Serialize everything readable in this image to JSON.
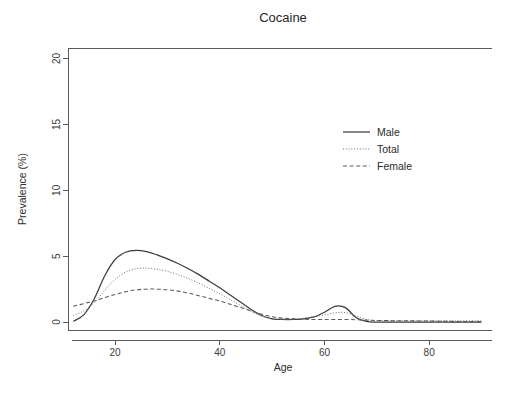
{
  "chart_data": {
    "type": "line",
    "title": "Cocaine",
    "xlabel": "Age",
    "ylabel": "Prevalence (%)",
    "xlim": [
      11,
      92
    ],
    "ylim": [
      -0.6,
      20.8
    ],
    "xticks": [
      20,
      40,
      60,
      80
    ],
    "yticks": [
      0,
      5,
      10,
      15,
      20
    ],
    "grid": false,
    "legend_position": "upper-right-inside",
    "x": [
      12,
      14,
      16,
      18,
      20,
      22,
      24,
      26,
      28,
      30,
      32,
      34,
      36,
      38,
      40,
      42,
      44,
      46,
      48,
      50,
      52,
      54,
      56,
      58,
      60,
      62,
      64,
      66,
      68,
      70,
      75,
      80,
      85,
      90
    ],
    "series": [
      {
        "name": "Male",
        "style": "solid",
        "values": [
          0.05,
          0.55,
          1.75,
          3.5,
          4.75,
          5.3,
          5.45,
          5.35,
          5.1,
          4.8,
          4.45,
          4.05,
          3.6,
          3.1,
          2.6,
          2.05,
          1.5,
          0.95,
          0.5,
          0.25,
          0.2,
          0.2,
          0.25,
          0.4,
          0.75,
          1.2,
          1.1,
          0.35,
          0.05,
          0.0,
          0.0,
          0.0,
          0.0,
          0.0
        ]
      },
      {
        "name": "Total",
        "style": "dotted",
        "values": [
          0.5,
          0.85,
          1.45,
          2.4,
          3.25,
          3.8,
          4.05,
          4.1,
          4.0,
          3.85,
          3.6,
          3.3,
          2.95,
          2.55,
          2.15,
          1.7,
          1.25,
          0.8,
          0.45,
          0.25,
          0.2,
          0.22,
          0.3,
          0.4,
          0.55,
          0.7,
          0.72,
          0.45,
          0.2,
          0.12,
          0.1,
          0.1,
          0.1,
          0.1
        ]
      },
      {
        "name": "Female",
        "style": "dashed",
        "values": [
          1.2,
          1.4,
          1.6,
          1.85,
          2.1,
          2.3,
          2.45,
          2.5,
          2.5,
          2.45,
          2.35,
          2.2,
          2.0,
          1.8,
          1.6,
          1.35,
          1.1,
          0.85,
          0.6,
          0.4,
          0.3,
          0.25,
          0.22,
          0.2,
          0.2,
          0.2,
          0.2,
          0.18,
          0.15,
          0.12,
          0.1,
          0.08,
          0.05,
          0.05
        ]
      }
    ],
    "legend_entries": [
      {
        "label": "Male",
        "style": "solid"
      },
      {
        "label": "Total",
        "style": "dotted"
      },
      {
        "label": "Female",
        "style": "dashed"
      }
    ]
  },
  "axis": {
    "x_tick_labels": [
      "20",
      "40",
      "60",
      "80"
    ],
    "y_tick_labels": [
      "0",
      "5",
      "10",
      "15",
      "20"
    ]
  },
  "colors": {
    "background": "#ffffff",
    "axis": "#5a5a5a",
    "male": "#3d3d3d",
    "total": "#6f6f6f",
    "female": "#5a5a5a",
    "text": "#2b2b2b"
  }
}
